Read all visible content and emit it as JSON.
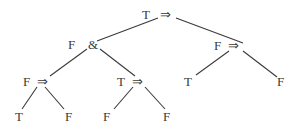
{
  "diagram": {
    "type": "evaluation-tree",
    "nodes": [
      {
        "id": "root",
        "value": "T",
        "op": "⇒",
        "vx": 142,
        "vy": 19,
        "ox": 160,
        "oy": 19
      },
      {
        "id": "n_and",
        "value": "F",
        "op": "&",
        "vx": 68,
        "vy": 49,
        "ox": 88,
        "oy": 49
      },
      {
        "id": "n_right",
        "value": "F",
        "op": "⇒",
        "vx": 214,
        "vy": 50,
        "ox": 228,
        "oy": 50
      },
      {
        "id": "n_ll",
        "value": "F",
        "op": "⇒",
        "vx": 23,
        "vy": 86,
        "ox": 37,
        "oy": 86
      },
      {
        "id": "n_lr",
        "value": "T",
        "op": "⇒",
        "vx": 117,
        "vy": 86,
        "ox": 132,
        "oy": 86
      },
      {
        "id": "leaf_rl",
        "value": "T",
        "op": "",
        "vx": 184,
        "vy": 86
      },
      {
        "id": "leaf_rr",
        "value": "F",
        "op": "",
        "vx": 277,
        "vy": 86
      },
      {
        "id": "leaf_1",
        "value": "T",
        "op": "",
        "vx": 15,
        "vy": 121
      },
      {
        "id": "leaf_2",
        "value": "F",
        "op": "",
        "vx": 65,
        "vy": 121
      },
      {
        "id": "leaf_3",
        "value": "F",
        "op": "",
        "vx": 103,
        "vy": 121
      },
      {
        "id": "leaf_4",
        "value": "F",
        "op": "",
        "vx": 163,
        "vy": 121
      }
    ],
    "edges": [
      {
        "from": "root",
        "to": "n_and",
        "x1": 158,
        "y1": 18,
        "x2": 97,
        "y2": 41
      },
      {
        "from": "root",
        "to": "n_right",
        "x1": 176,
        "y1": 18,
        "x2": 243,
        "y2": 43
      },
      {
        "from": "n_and",
        "to": "n_ll",
        "x1": 87,
        "y1": 49,
        "x2": 50,
        "y2": 76
      },
      {
        "from": "n_and",
        "to": "n_lr",
        "x1": 100,
        "y1": 49,
        "x2": 135,
        "y2": 76
      },
      {
        "from": "n_right",
        "to": "leaf_rl",
        "x1": 229,
        "y1": 51,
        "x2": 196,
        "y2": 75
      },
      {
        "from": "n_right",
        "to": "leaf_rr",
        "x1": 243,
        "y1": 51,
        "x2": 277,
        "y2": 77
      },
      {
        "from": "n_ll",
        "to": "leaf_1",
        "x1": 37,
        "y1": 87,
        "x2": 22,
        "y2": 109
      },
      {
        "from": "n_ll",
        "to": "leaf_2",
        "x1": 45,
        "y1": 87,
        "x2": 64,
        "y2": 109
      },
      {
        "from": "n_lr",
        "to": "leaf_3",
        "x1": 133,
        "y1": 87,
        "x2": 114,
        "y2": 109
      },
      {
        "from": "n_lr",
        "to": "leaf_4",
        "x1": 145,
        "y1": 87,
        "x2": 165,
        "y2": 109
      }
    ],
    "colors": {
      "ink": "#3a3a3a",
      "background": "#ffffff"
    }
  }
}
